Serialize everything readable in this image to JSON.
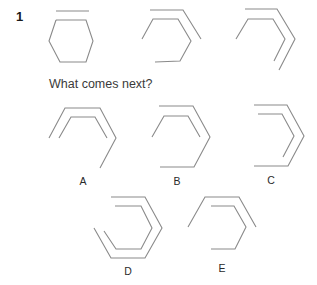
{
  "question": {
    "number": "1",
    "prompt": "What comes next?"
  },
  "sequence": [
    {
      "id": "seq-1",
      "description": "full hexagon with a separate line above the top edge",
      "paths": [
        "56,11 89,11",
        "56,20 86,20 93,41 86,62 60,62 49,41 56,20"
      ]
    },
    {
      "id": "seq-2",
      "description": "open hexagon (left-bottom edge missing) with outer line wrapping top and upper-right",
      "paths": [
        "150,10 183,10 201,39",
        "142,39 153,19 178,19 191,41 180,61 155,62"
      ]
    },
    {
      "id": "seq-3",
      "description": "partial hexagon (top-left, top, right edges) with outer line wrapping top, upper-right and lower-right",
      "paths": [
        "245,9 277,9 295,39 279,70",
        "236,39 248,19 273,19 285,39 274,61"
      ]
    }
  ],
  "options": [
    {
      "label": "A",
      "label_pos": [
        83,
        175
      ],
      "paths": [
        "49,138 65,108 100,108 116,138 100,168",
        "59,138 71,117 95,117 107,138"
      ]
    },
    {
      "label": "B",
      "label_pos": [
        177,
        175
      ],
      "paths": [
        "159,106 193,106 210,137 194,167 160,167",
        "152,137 164,116 188,116 200,137"
      ]
    },
    {
      "label": "C",
      "label_pos": [
        271,
        174
      ],
      "paths": [
        "254,105 287,105 304,136 288,166 254,166",
        "258,114 282,114 294,136 283,157"
      ]
    },
    {
      "label": "D",
      "label_pos": [
        128,
        265
      ],
      "paths": [
        "111,197 145,197 162,228 145,258 111,258 94,228",
        "115,206 141,206 152,228 141,249 116,249 104,231"
      ]
    },
    {
      "label": "E",
      "label_pos": [
        222,
        262
      ],
      "paths": [
        "188,227 205,197 239,197 256,227",
        "211,206 234,206 246,227 235,249 211,249"
      ]
    }
  ],
  "colors": {
    "line": "#8a8a8a",
    "text": "#2a2a2a",
    "background": "#ffffff"
  }
}
